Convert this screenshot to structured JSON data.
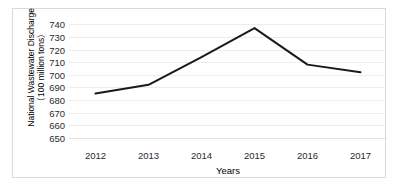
{
  "chart_data": {
    "type": "line",
    "title": "",
    "xlabel": "Years",
    "ylabel": "National Wastewater Discharge (100 million tons)",
    "ylabel_lines": [
      "National Wastewater Discharge",
      "（100 million tons）"
    ],
    "categories": [
      "2012",
      "2013",
      "2014",
      "2015",
      "2016",
      "2017"
    ],
    "values": [
      685,
      692,
      714,
      737,
      708,
      702
    ],
    "series": [
      {
        "name": "National Wastewater Discharge",
        "values": [
          685,
          692,
          714,
          737,
          708,
          702
        ]
      }
    ],
    "yticks": [
      650,
      660,
      670,
      680,
      690,
      700,
      710,
      720,
      730,
      740
    ],
    "ylim": [
      645,
      745
    ],
    "grid": true,
    "grid_color": "#ececec",
    "legend": "none",
    "line_color": "#1a1a1a",
    "line_width": 2,
    "markers": false,
    "border_color": "#d9d9d9",
    "background": "#ffffff"
  }
}
